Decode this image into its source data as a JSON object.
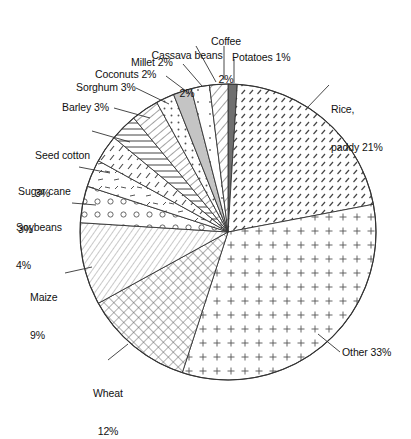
{
  "chart_data": {
    "type": "pie",
    "title": "",
    "subtitle": "",
    "xlabel": "",
    "ylabel": "",
    "legend_position": "none",
    "grid": false,
    "units": "percent",
    "total": 100,
    "start_angle_deg": 0,
    "direction": "clockwise",
    "categories": [
      "Potatoes",
      "Rice, paddy",
      "Other",
      "Wheat",
      "Maize",
      "Soybeans",
      "Sugar cane",
      "Seed cotton",
      "Barley",
      "Sorghum",
      "Coconuts",
      "Millet",
      "Cassava beans",
      "Coffee"
    ],
    "values": [
      1,
      21,
      33,
      12,
      9,
      4,
      3,
      3,
      3,
      3,
      2,
      2,
      2,
      2
    ],
    "slices": [
      {
        "name": "Potatoes",
        "value": 1,
        "label": "Potatoes 1%",
        "pattern": "solid-dark-gray",
        "fill": "#6f6f6f"
      },
      {
        "name": "Rice, paddy",
        "value": 21,
        "label": "Rice,\npaddy 21%",
        "pattern": "diagonal-dashes",
        "fill": "#ffffff"
      },
      {
        "name": "Other",
        "value": 33,
        "label": "Other 33%",
        "pattern": "plus-grid",
        "fill": "#ffffff"
      },
      {
        "name": "Wheat",
        "value": 12,
        "label": "Wheat\n12%",
        "pattern": "cross-hatch",
        "fill": "#ffffff"
      },
      {
        "name": "Maize",
        "value": 9,
        "label": "Maize\n9%",
        "pattern": "fine-diagonal",
        "fill": "#ffffff"
      },
      {
        "name": "Soybeans",
        "value": 4,
        "label": "Soybeans\n4%",
        "pattern": "circles",
        "fill": "#ffffff"
      },
      {
        "name": "Sugar cane",
        "value": 3,
        "label": "Sugar cane\n3%",
        "pattern": "short-dashes",
        "fill": "#ffffff"
      },
      {
        "name": "Seed cotton",
        "value": 3,
        "label": "Seed cotton\n3%",
        "pattern": "diagonal-ticks",
        "fill": "#ffffff"
      },
      {
        "name": "Barley",
        "value": 3,
        "label": "Barley 3%",
        "pattern": "horizontal-lines",
        "fill": "#ffffff"
      },
      {
        "name": "Sorghum",
        "value": 3,
        "label": "Sorghum 3%",
        "pattern": "diagonal-lines",
        "fill": "#ffffff"
      },
      {
        "name": "Coconuts",
        "value": 2,
        "label": "Coconuts 2%",
        "pattern": "dense-dots",
        "fill": "#ffffff"
      },
      {
        "name": "Millet",
        "value": 2,
        "label": "Millet 2%",
        "pattern": "solid-light-gray",
        "fill": "#c4c4c4"
      },
      {
        "name": "Cassava beans",
        "value": 2,
        "label": "Cassava beans\n2%",
        "pattern": "sparse-dots",
        "fill": "#ffffff"
      },
      {
        "name": "Coffee",
        "value": 2,
        "label": "Coffee\n2%",
        "pattern": "wide-diagonal",
        "fill": "#ffffff"
      }
    ]
  },
  "labels": {
    "coffee_l1": "Coffee",
    "coffee_l2": "2%",
    "cassava_l1": "Cassava beans",
    "cassava_l2": "2%",
    "potatoes": "Potatoes 1%",
    "millet": "Millet 2%",
    "coconuts": "Coconuts 2%",
    "sorghum": "Sorghum 3%",
    "barley": "Barley 3%",
    "seedcotton_l1": "Seed cotton",
    "seedcotton_l2": "3%",
    "sugarcane_l1": "Sugar cane",
    "sugarcane_l2": "3%",
    "soybeans_l1": "Soybeans",
    "soybeans_l2": "4%",
    "maize_l1": "Maize",
    "maize_l2": "9%",
    "wheat_l1": "Wheat",
    "wheat_l2": "12%",
    "rice_l1": "Rice,",
    "rice_l2": "paddy 21%",
    "other": "Other 33%"
  },
  "colors": {
    "stroke": "#333333",
    "text": "#111111",
    "background": "#ffffff",
    "potatoes_fill": "#6f6f6f",
    "millet_fill": "#c4c4c4"
  }
}
